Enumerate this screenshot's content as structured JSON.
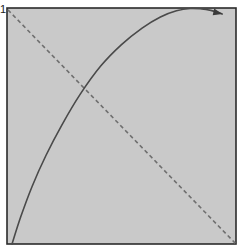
{
  "figure": {
    "width": 248,
    "height": 249,
    "background_color": "#ffffff",
    "plot_background_color": "#c9c9c9",
    "frame_color": "#2b2b2b"
  },
  "axes": {
    "y_tick_labels": [
      "1"
    ],
    "x_tick_labels": [],
    "x_axis_label": "",
    "y_axis_label": "",
    "title": "",
    "grid": false,
    "plot_box": {
      "left": 7,
      "top": 8,
      "right": 236,
      "bottom": 244
    }
  },
  "chart_data": {
    "type": "line",
    "title": "",
    "xlabel": "",
    "ylabel": "",
    "xlim": [
      0,
      1
    ],
    "ylim": [
      0,
      1
    ],
    "grid": false,
    "legend_position": "none",
    "annotations": [
      {
        "name": "curve-arrowhead",
        "shape": "arrowhead",
        "x": 0.94,
        "y": 0.975,
        "direction": "right",
        "color": "#3a3a3a"
      }
    ],
    "series": [
      {
        "name": "concave-curve",
        "style": "solid",
        "color": "#4a4a4a",
        "width": 1.6,
        "arrow_end": true,
        "x": [
          0.022,
          0.06,
          0.11,
          0.17,
          0.24,
          0.32,
          0.41,
          0.5,
          0.59,
          0.67,
          0.74,
          0.8,
          0.85,
          0.89,
          0.92,
          0.94
        ],
        "y": [
          0.0,
          0.115,
          0.245,
          0.375,
          0.505,
          0.635,
          0.755,
          0.845,
          0.915,
          0.962,
          0.988,
          0.998,
          0.996,
          0.99,
          0.982,
          0.975
        ]
      },
      {
        "name": "diagonal-reference-line",
        "style": "dashed",
        "color": "#6f6f6f",
        "width": 1.6,
        "dash_on": 4,
        "dash_off": 3,
        "x": [
          0.004,
          1.0
        ],
        "y": [
          0.992,
          0.0
        ]
      }
    ],
    "intersection": {
      "x": 0.3,
      "y": 0.695
    }
  }
}
